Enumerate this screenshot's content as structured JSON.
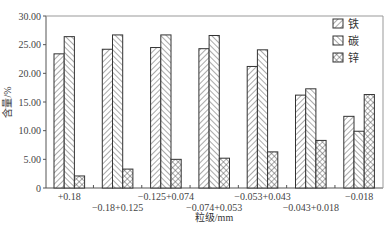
{
  "chart_data": {
    "type": "bar",
    "title": "",
    "xlabel": "粒级/mm",
    "ylabel": "含量/%",
    "ylim": [
      0,
      30
    ],
    "yticks": [
      "0",
      "5.00",
      "10.00",
      "15.00",
      "20.00",
      "25.00",
      "30.00"
    ],
    "grid": false,
    "legend_position": "upper right (inside)",
    "categories": [
      "+0.18",
      "-0.18+0.125",
      "-0.125+0.074",
      "-0.074+0.053",
      "-0.053+0.043",
      "-0.043+0.018",
      "-0.018"
    ],
    "category_display": [
      "+0.18",
      "−0.18+0.125",
      "−0.125+0.074",
      "−0.074+0.053",
      "−0.053+0.043",
      "−0.043+0.018",
      "−0.018"
    ],
    "series": [
      {
        "name": "铁",
        "pattern": "diagonal-forward",
        "values": [
          23.4,
          24.2,
          24.5,
          24.3,
          21.2,
          16.2,
          12.5
        ]
      },
      {
        "name": "碳",
        "pattern": "diagonal-backward",
        "values": [
          26.4,
          26.7,
          26.7,
          26.6,
          24.1,
          17.3,
          9.9
        ]
      },
      {
        "name": "锌",
        "pattern": "crosshatch",
        "values": [
          2.1,
          3.3,
          5.0,
          5.2,
          6.3,
          8.3,
          16.3
        ]
      }
    ]
  },
  "colors": {
    "axis": "#555555",
    "bar_outline": "#333333",
    "hatch": "#555555",
    "background": "#ffffff"
  }
}
